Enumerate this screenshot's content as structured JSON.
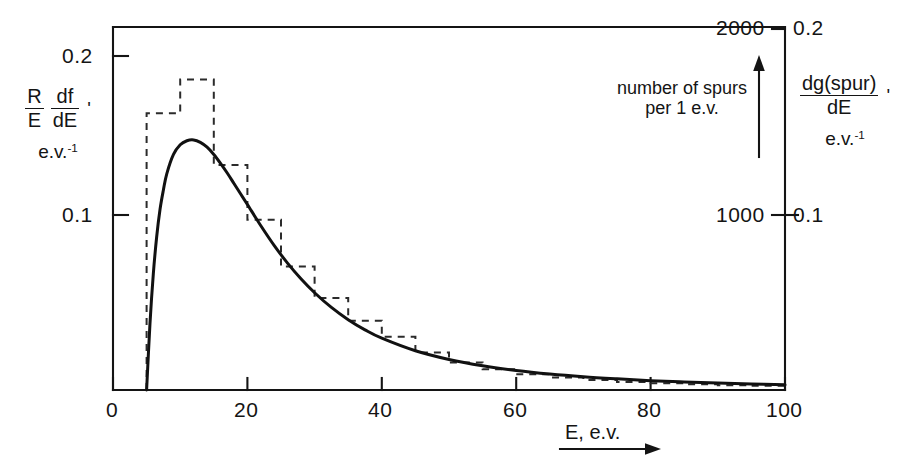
{
  "figure": {
    "background": "#ffffff",
    "ink_color": "#141414",
    "curve_color": "#111111",
    "histogram_color": "#333333"
  },
  "axes": {
    "x": {
      "label_text": "E, e.v.",
      "arrow": "right-arrow",
      "ticks": [
        "0",
        "20",
        "40",
        "60",
        "80",
        "100"
      ],
      "tick_values": [
        0,
        20,
        40,
        60,
        80,
        100
      ],
      "range": [
        0,
        100
      ]
    },
    "y_left": {
      "numerator": "R",
      "denominator": "E",
      "frac2_numerator": "df",
      "frac2_denominator": "dE",
      "prime": "'",
      "units": "e.v.",
      "units_exponent": "-1",
      "ticks": [
        "0.2",
        "0.1"
      ],
      "tick_values": [
        0.2,
        0.1
      ],
      "range": [
        0,
        0.225
      ]
    },
    "y_right_inner": {
      "ticks": [
        "2000",
        "1000"
      ],
      "tick_values": [
        2000,
        1000
      ],
      "range": [
        0,
        2250
      ],
      "note_line1": "number of spurs",
      "note_line2": "per 1 e.v.",
      "arrow": "up-arrow"
    },
    "y_right_outer": {
      "numerator": "dg(spur)",
      "denominator": "dE",
      "prime": "'",
      "units": "e.v.",
      "units_exponent": "-1",
      "ticks": [
        "0.2",
        "0.1"
      ],
      "tick_values": [
        0.2,
        0.1
      ],
      "range": [
        0,
        0.225
      ]
    }
  },
  "chart_data": {
    "type": "line",
    "title": "",
    "xlabel": "E, e.v.",
    "ylabel": "(R/E) df/dE'  e.v.^-1",
    "xlim": [
      0,
      100
    ],
    "ylim": [
      0,
      0.225
    ],
    "grid": false,
    "legend": "none",
    "series": [
      {
        "name": "smooth distribution curve",
        "style": "solid",
        "x": [
          5.0,
          5.5,
          6.0,
          6.5,
          7.0,
          7.5,
          8.0,
          9.0,
          10.0,
          11.0,
          12.0,
          13.0,
          14.0,
          15.0,
          16.0,
          17.0,
          18.0,
          19.0,
          20.0,
          22.0,
          24.0,
          26.0,
          28.0,
          30.0,
          32.5,
          35.0,
          37.5,
          40.0,
          45.0,
          50.0,
          55.0,
          60.0,
          65.0,
          70.0,
          75.0,
          80.0,
          85.0,
          90.0,
          95.0,
          100.0
        ],
        "y": [
          0.0,
          0.041,
          0.072,
          0.095,
          0.112,
          0.124,
          0.134,
          0.146,
          0.152,
          0.1545,
          0.155,
          0.1535,
          0.1505,
          0.146,
          0.1405,
          0.1345,
          0.128,
          0.1215,
          0.115,
          0.1018,
          0.0895,
          0.0785,
          0.0688,
          0.0603,
          0.0512,
          0.0436,
          0.0373,
          0.0321,
          0.0243,
          0.0189,
          0.015,
          0.0121,
          0.0099,
          0.0082,
          0.0069,
          0.0058,
          0.005,
          0.0043,
          0.0037,
          0.0032
        ]
      },
      {
        "name": "spur-count histogram",
        "style": "dashed",
        "bin_edges": [
          5,
          10,
          15,
          20,
          25,
          30,
          35,
          40,
          45,
          50,
          55,
          60,
          65,
          70,
          75,
          80,
          85,
          90,
          95,
          100
        ],
        "bin_heights": [
          0.1715,
          0.1925,
          0.1395,
          0.1055,
          0.0765,
          0.057,
          0.043,
          0.033,
          0.0232,
          0.017,
          0.0128,
          0.0098,
          0.0078,
          0.0062,
          0.005,
          0.0042,
          0.0035,
          0.003,
          0.0026
        ]
      }
    ]
  }
}
